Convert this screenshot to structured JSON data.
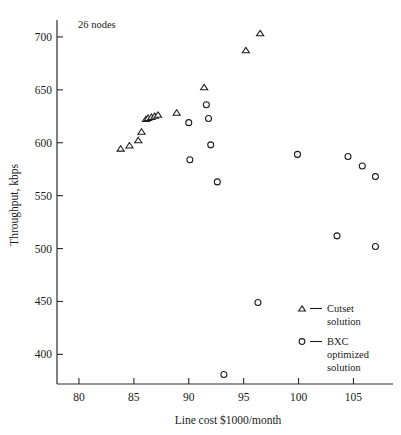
{
  "chart_data": {
    "type": "scatter",
    "title": "",
    "annotation": "26 nodes",
    "xlabel": "Line cost $1000/month",
    "ylabel": "Throughput, kbps",
    "xlim": [
      78.0,
      108.6
    ],
    "ylim": [
      372,
      716
    ],
    "xticks": [
      80,
      85,
      90,
      95,
      100,
      105
    ],
    "yticks": [
      400,
      450,
      500,
      550,
      600,
      650,
      700
    ],
    "xtick_labels": [
      "80",
      "85",
      "90",
      "95",
      "100",
      "105"
    ],
    "ytick_labels": [
      "400",
      "450",
      "500",
      "550",
      "600",
      "650",
      "700"
    ],
    "grid": false,
    "legend_position": "bottom-right",
    "series": [
      {
        "name": "Cutset solution",
        "marker": "triangle",
        "points": [
          {
            "x": 83.8,
            "y": 594
          },
          {
            "x": 84.6,
            "y": 597
          },
          {
            "x": 85.4,
            "y": 602
          },
          {
            "x": 85.7,
            "y": 610
          },
          {
            "x": 86.1,
            "y": 622
          },
          {
            "x": 86.3,
            "y": 623
          },
          {
            "x": 86.6,
            "y": 624
          },
          {
            "x": 86.9,
            "y": 625
          },
          {
            "x": 87.2,
            "y": 626
          },
          {
            "x": 88.9,
            "y": 628
          },
          {
            "x": 91.4,
            "y": 652
          },
          {
            "x": 95.2,
            "y": 687
          },
          {
            "x": 96.5,
            "y": 703
          }
        ]
      },
      {
        "name": "BXC optimized solution",
        "marker": "circle",
        "points": [
          {
            "x": 90.0,
            "y": 619
          },
          {
            "x": 90.1,
            "y": 584
          },
          {
            "x": 91.6,
            "y": 636
          },
          {
            "x": 91.8,
            "y": 623
          },
          {
            "x": 92.0,
            "y": 598
          },
          {
            "x": 92.6,
            "y": 563
          },
          {
            "x": 93.2,
            "y": 381
          },
          {
            "x": 96.3,
            "y": 449
          },
          {
            "x": 99.9,
            "y": 589
          },
          {
            "x": 103.5,
            "y": 512
          },
          {
            "x": 104.5,
            "y": 587
          },
          {
            "x": 105.8,
            "y": 578
          },
          {
            "x": 107.0,
            "y": 568
          },
          {
            "x": 107.0,
            "y": 502
          }
        ]
      }
    ]
  },
  "legend": {
    "entries": [
      {
        "marker": "triangle",
        "dash": "—",
        "lines": [
          "Cutset",
          "solution"
        ]
      },
      {
        "marker": "circle",
        "dash": "—",
        "lines": [
          "BXC",
          "optimized",
          "solution"
        ]
      }
    ]
  },
  "colors": {
    "ink": "#1a1a1a",
    "axis": "#2b2b2b",
    "background": "#ffffff",
    "marker_fill": "#ffffff"
  }
}
